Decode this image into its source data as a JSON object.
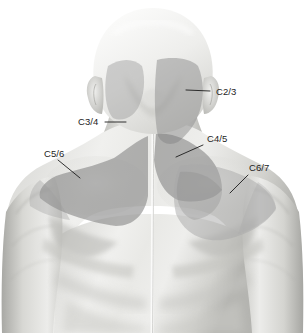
{
  "figure": {
    "background_color": "#ffffff",
    "width": 307,
    "height": 333,
    "view": "posterior"
  },
  "palette": {
    "background": "#ffffff",
    "skin_light": "#f2f2f0",
    "skin_mid": "#cfcfcb",
    "skin_shadow": "#a9a9a5",
    "skin_deep_shadow": "#8e8e8a",
    "overlay_light": "#b0b0b0",
    "overlay_mid": "#9a9a9a",
    "overlay_dark": "#8a8a8a",
    "label_color": "#1c1c1c",
    "leader_color": "#1c1c1c"
  },
  "labels": [
    {
      "id": "c2-3",
      "text": "C2/3",
      "text_x": 216,
      "text_y": 95,
      "leader": "M 210 91 L 186 90",
      "anchor_region": "right occipital / suboccipital patch"
    },
    {
      "id": "c3-4",
      "text": "C3/4",
      "text_x": 78,
      "text_y": 125,
      "leader": "M 105 122 L 126 122",
      "anchor_region": "left lateral neck patch"
    },
    {
      "id": "c4-5",
      "text": "C4/5",
      "text_x": 207,
      "text_y": 142,
      "leader": "M 203 145 L 176 157",
      "anchor_region": "right lower neck / upper trapezius"
    },
    {
      "id": "c5-6",
      "text": "C5/6",
      "text_x": 44,
      "text_y": 157,
      "leader": "M 58 160 L 80 178",
      "anchor_region": "left supraspinous / trapezius shoulder"
    },
    {
      "id": "c6-7",
      "text": "C6/7",
      "text_x": 249,
      "text_y": 171,
      "leader": "M 248 175 L 230 193",
      "anchor_region": "right shoulder / scapular region"
    }
  ],
  "pain_regions": [
    {
      "id": "region-c2-3",
      "label": "C2/3",
      "side": "right",
      "tone": "overlay_mid",
      "description": "occipital and upper posterior neck"
    },
    {
      "id": "region-c3-4",
      "label": "C3/4",
      "side": "left",
      "tone": "overlay_light",
      "description": "left lateral upper neck below ear"
    },
    {
      "id": "region-c4-5",
      "label": "C4/5",
      "side": "right",
      "tone": "overlay_dark",
      "description": "lower neck extending to upper trapezius"
    },
    {
      "id": "region-c5-6",
      "label": "C5/6",
      "side": "left",
      "tone": "overlay_dark",
      "description": "left supraspinatus fossa and trapezius ridge"
    },
    {
      "id": "region-c6-7",
      "label": "C6/7",
      "side": "right",
      "tone": "overlay_light",
      "description": "right shoulder over scapula"
    }
  ]
}
